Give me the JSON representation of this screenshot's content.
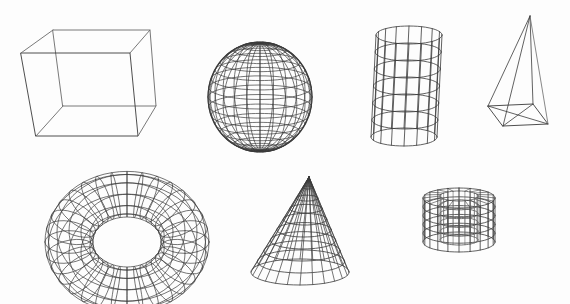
{
  "title": "Wireframe 3D primitives",
  "colors": {
    "background": "#fdfdfd",
    "line": "#3a3a3a",
    "line_light": "#6a6a6a"
  },
  "shapes": [
    {
      "id": "box",
      "label": "Box",
      "type": "box"
    },
    {
      "id": "sphere",
      "label": "Sphere",
      "type": "sphere"
    },
    {
      "id": "cylinder",
      "label": "Cylinder",
      "type": "cylinder"
    },
    {
      "id": "pyramid",
      "label": "Pyramid",
      "type": "pyramid"
    },
    {
      "id": "torus",
      "label": "Torus",
      "type": "torus"
    },
    {
      "id": "cone",
      "label": "Cone",
      "type": "cone"
    },
    {
      "id": "tube",
      "label": "Tube",
      "type": "tube"
    }
  ]
}
